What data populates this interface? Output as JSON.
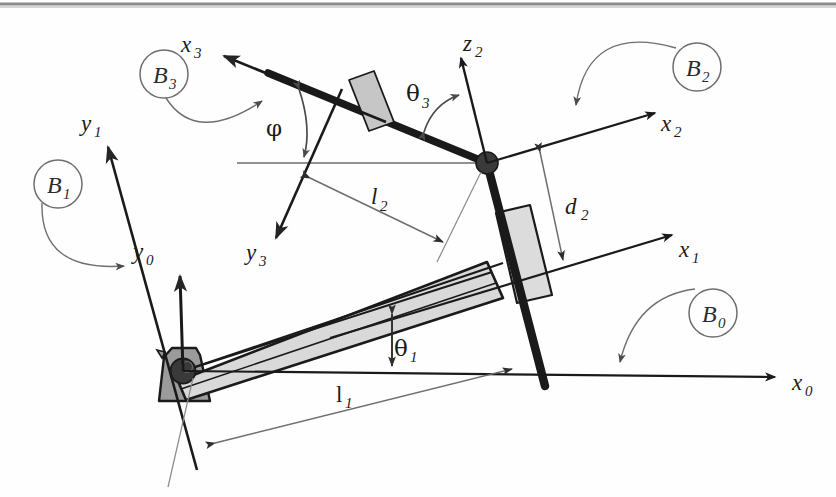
{
  "figure": {
    "border_color": "#8c8c8c",
    "background": "#fefefe"
  },
  "colors": {
    "link_dark": "#1a1a1a",
    "link_gray_fill": "#d2d2d2",
    "link_gray_stroke": "#1a1a1a",
    "base_fill": "#9b9b9b",
    "base_stroke": "#1a1a1a",
    "pivot_fill": "#3a3a3a",
    "leader_line": "#6e6e6e",
    "axis_line": "#1a1a1a",
    "dimension_line": "#6e6e6e",
    "frame_circle": "#6e6e6e"
  },
  "frames": [
    {
      "id": "B0",
      "base": "B",
      "sub": "0",
      "label": "B₀",
      "x": 713,
      "y": 313,
      "r": 24
    },
    {
      "id": "B1",
      "base": "B",
      "sub": "1",
      "label": "B₁",
      "x": 58,
      "y": 184,
      "r": 24
    },
    {
      "id": "B2",
      "base": "B",
      "sub": "2",
      "label": "B₂",
      "x": 697,
      "y": 67,
      "r": 24
    },
    {
      "id": "B3",
      "base": "B",
      "sub": "3",
      "label": "B₃",
      "x": 164,
      "y": 74,
      "r": 24
    }
  ],
  "axes": [
    {
      "id": "x0",
      "base": "x",
      "sub": "0",
      "label": "x₀",
      "label_x": 800,
      "label_y": 383
    },
    {
      "id": "y0",
      "base": "y",
      "sub": "0",
      "label": "y₀",
      "label_x": 139,
      "label_y": 252
    },
    {
      "id": "x1",
      "base": "x",
      "sub": "1",
      "label": "x₁",
      "label_x": 686,
      "label_y": 250
    },
    {
      "id": "y1",
      "base": "y",
      "sub": "1",
      "label": "y₁",
      "label_x": 88,
      "label_y": 124
    },
    {
      "id": "x2",
      "base": "x",
      "sub": "2",
      "label": "x₂",
      "label_x": 668,
      "label_y": 124
    },
    {
      "id": "z2",
      "base": "z",
      "sub": "2",
      "label": "z₂",
      "label_x": 470,
      "label_y": 44
    },
    {
      "id": "x3",
      "base": "x",
      "sub": "3",
      "label": "x₃",
      "label_x": 188,
      "label_y": 45
    },
    {
      "id": "y3",
      "base": "y",
      "sub": "3",
      "label": "y₃",
      "label_x": 253,
      "label_y": 253
    }
  ],
  "angles": [
    {
      "id": "theta1",
      "glyph": "θ",
      "sub": "1",
      "label": "θ₁",
      "label_x": 401,
      "label_y": 348
    },
    {
      "id": "theta3",
      "glyph": "θ",
      "sub": "3",
      "label": "θ₃",
      "label_x": 413,
      "label_y": 93
    },
    {
      "id": "phi",
      "glyph": "φ",
      "sub": "",
      "label": "φ",
      "label_x": 273,
      "label_y": 128
    }
  ],
  "dimensions": [
    {
      "id": "l1",
      "glyph": "l",
      "sub": "1",
      "label": "l₁",
      "label_x": 339,
      "label_y": 394,
      "kind": "length"
    },
    {
      "id": "l2",
      "glyph": "l",
      "sub": "2",
      "label": "l₂",
      "label_x": 375,
      "label_y": 196,
      "kind": "length"
    },
    {
      "id": "d2",
      "glyph": "d",
      "sub": "2",
      "label": "d₂",
      "label_x": 573,
      "label_y": 206,
      "kind": "offset"
    }
  ],
  "components": [
    {
      "id": "ground-base",
      "name": "ground-base-trapezoid",
      "type": "fixed-support"
    },
    {
      "id": "origin-pivot",
      "name": "origin-revolute-joint",
      "type": "revolute-joint"
    },
    {
      "id": "lower-arm",
      "name": "link-1-lower-arm",
      "type": "rigid-link"
    },
    {
      "id": "vertical-link",
      "name": "link-2-vertical-bar",
      "type": "rigid-link"
    },
    {
      "id": "lower-slider",
      "name": "prismatic-slider-block-lower",
      "type": "prismatic-joint"
    },
    {
      "id": "elbow-pivot",
      "name": "elbow-revolute-joint",
      "type": "revolute-joint"
    },
    {
      "id": "upper-arm",
      "name": "link-3-upper-arm",
      "type": "rigid-link"
    },
    {
      "id": "upper-slider",
      "name": "prismatic-slider-block-upper",
      "type": "prismatic-joint"
    }
  ]
}
